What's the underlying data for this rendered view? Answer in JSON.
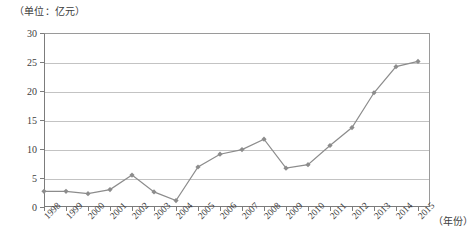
{
  "chart_data": {
    "type": "line",
    "title": "",
    "unit_label": "（单位：亿元）",
    "xlabel": "（年份）",
    "ylabel": "",
    "categories": [
      "1998",
      "1999",
      "2000",
      "2001",
      "2002",
      "2003",
      "2004",
      "2005",
      "2006",
      "2007",
      "2008",
      "2009",
      "2010",
      "2011",
      "2012",
      "2013",
      "2014",
      "2015"
    ],
    "values": [
      2.7,
      2.7,
      2.3,
      3.0,
      5.5,
      2.6,
      1.1,
      6.9,
      9.1,
      9.9,
      11.7,
      6.7,
      7.3,
      10.6,
      13.7,
      19.7,
      24.2,
      25.1
    ],
    "ylim": [
      0,
      30
    ],
    "yticks": [
      0,
      5,
      10,
      15,
      20,
      25,
      30
    ],
    "ytick_labels": [
      "0",
      "5",
      "10",
      "15",
      "20",
      "25",
      "30"
    ],
    "grid": true,
    "legend": "none",
    "series_color": "#8c8c8c",
    "marker": "diamond",
    "marker_color": "#8c8c8c"
  },
  "caption": "",
  "colors": {
    "axis": "#7c7c7c",
    "grid": "#c3c3c3",
    "text": "#3d3d3d",
    "line": "#8c8c8c"
  }
}
